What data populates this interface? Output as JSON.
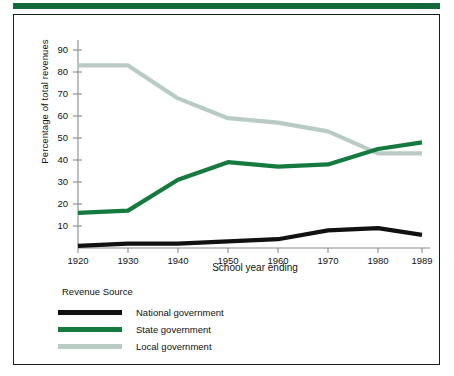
{
  "figure": {
    "accent_color": "#14693a",
    "frame_color": "#1c1c1c",
    "background": "#ffffff"
  },
  "legend": {
    "title": "Revenue Source",
    "entries": [
      {
        "label": "National government",
        "color": "#111111"
      },
      {
        "label": "State government",
        "color": "#157a3f"
      },
      {
        "label": "Local government",
        "color": "#b9ccc4"
      }
    ]
  },
  "chart_data": {
    "type": "line",
    "title": "",
    "xlabel": "School year ending",
    "ylabel": "Percentage of total revenues",
    "x": [
      1920,
      1930,
      1940,
      1950,
      1960,
      1970,
      1980,
      1989
    ],
    "xlim": [
      1920,
      1989
    ],
    "ylim": [
      0,
      95
    ],
    "xticks": [
      1920,
      1930,
      1940,
      1950,
      1960,
      1970,
      1980,
      1989
    ],
    "xtick_labels": [
      "1920",
      "1930",
      "1940",
      "1950",
      "1960",
      "1970",
      "1980",
      "1989"
    ],
    "yticks": [
      10,
      20,
      30,
      40,
      50,
      60,
      70,
      80,
      90
    ],
    "ytick_labels": [
      "10",
      "20",
      "30",
      "40",
      "50",
      "60",
      "70",
      "80",
      "90"
    ],
    "grid": false,
    "legend_position": "below-left",
    "series": [
      {
        "name": "National government",
        "color": "#111111",
        "values": [
          1,
          2,
          2,
          3,
          4,
          8,
          9,
          6
        ]
      },
      {
        "name": "State government",
        "color": "#157a3f",
        "values": [
          16,
          17,
          31,
          39,
          37,
          38,
          45,
          48
        ]
      },
      {
        "name": "Local government",
        "color": "#b9ccc4",
        "values": [
          83,
          83,
          68,
          59,
          57,
          53,
          43,
          43
        ]
      }
    ]
  }
}
